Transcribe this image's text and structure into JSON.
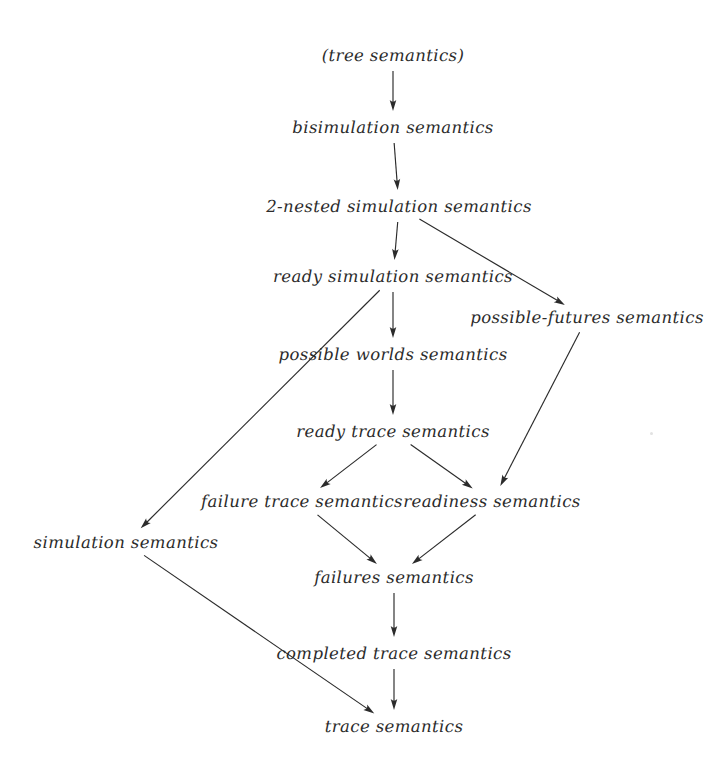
{
  "diagram": {
    "background_color": "#ffffff",
    "text_color": "#2b2b2b",
    "edge_color": "#2b2b2b",
    "width": 725,
    "height": 773,
    "nodes": [
      {
        "id": "tree",
        "label": "(tree semantics)",
        "x": 393,
        "y": 56,
        "half_w": 71
      },
      {
        "id": "bisimulation",
        "label": "bisimulation semantics",
        "x": 393,
        "y": 128,
        "half_w": 98
      },
      {
        "id": "two_nested",
        "label": "2-nested simulation semantics",
        "x": 399,
        "y": 207,
        "half_w": 128
      },
      {
        "id": "ready_simulation",
        "label": "ready simulation semantics",
        "x": 393,
        "y": 277,
        "half_w": 113
      },
      {
        "id": "possible_futures",
        "label": "possible-futures semantics",
        "x": 587,
        "y": 318,
        "half_w": 109
      },
      {
        "id": "possible_worlds",
        "label": "possible worlds semantics",
        "x": 393,
        "y": 355,
        "half_w": 110
      },
      {
        "id": "ready_trace",
        "label": "ready trace semantics",
        "x": 393,
        "y": 432,
        "half_w": 94
      },
      {
        "id": "failure_trace",
        "label": "failure trace semantics",
        "x": 302,
        "y": 502,
        "half_w": 94
      },
      {
        "id": "readiness",
        "label": "readiness semantics",
        "x": 492,
        "y": 502,
        "half_w": 87
      },
      {
        "id": "simulation",
        "label": "simulation semantics",
        "x": 126,
        "y": 543,
        "half_w": 89
      },
      {
        "id": "failures",
        "label": "failures semantics",
        "x": 394,
        "y": 578,
        "half_w": 73
      },
      {
        "id": "completed_trace",
        "label": "completed trace semantics",
        "x": 394,
        "y": 654,
        "half_w": 116
      },
      {
        "id": "trace",
        "label": "trace semantics",
        "x": 394,
        "y": 727,
        "half_w": 63
      }
    ],
    "edges": [
      {
        "id": "tree-to-bisimulation",
        "from": "tree",
        "to": "bisimulation"
      },
      {
        "id": "bisimulation-to-2-nested",
        "from": "bisimulation",
        "to": "two_nested"
      },
      {
        "id": "2-nested-to-ready-simulation",
        "from": "two_nested",
        "to": "ready_simulation"
      },
      {
        "id": "2-nested-to-possible-futures",
        "from": "two_nested",
        "to": "possible_futures"
      },
      {
        "id": "ready-simulation-to-possible-worlds",
        "from": "ready_simulation",
        "to": "possible_worlds"
      },
      {
        "id": "ready-simulation-to-simulation",
        "from": "ready_simulation",
        "to": "simulation"
      },
      {
        "id": "possible-worlds-to-ready-trace",
        "from": "possible_worlds",
        "to": "ready_trace"
      },
      {
        "id": "possible-futures-to-readiness",
        "from": "possible_futures",
        "to": "readiness"
      },
      {
        "id": "ready-trace-to-failure-trace",
        "from": "ready_trace",
        "to": "failure_trace"
      },
      {
        "id": "ready-trace-to-readiness",
        "from": "ready_trace",
        "to": "readiness"
      },
      {
        "id": "failure-trace-to-failures",
        "from": "failure_trace",
        "to": "failures"
      },
      {
        "id": "readiness-to-failures",
        "from": "readiness",
        "to": "failures"
      },
      {
        "id": "failures-to-completed-trace",
        "from": "failures",
        "to": "completed_trace"
      },
      {
        "id": "completed-trace-to-trace",
        "from": "completed_trace",
        "to": "trace"
      },
      {
        "id": "simulation-to-trace",
        "from": "simulation",
        "to": "trace"
      }
    ],
    "speck": {
      "x": 650,
      "y": 432
    }
  }
}
